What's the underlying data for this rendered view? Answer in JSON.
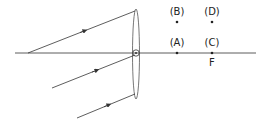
{
  "diagram": {
    "type": "converging-lens-ray-diagram",
    "labels": {
      "A": "(A)",
      "B": "(B)",
      "C": "(C)",
      "D": "(D)",
      "focus": "F"
    },
    "colors": {
      "line": "#333333",
      "background": "#ffffff"
    }
  }
}
